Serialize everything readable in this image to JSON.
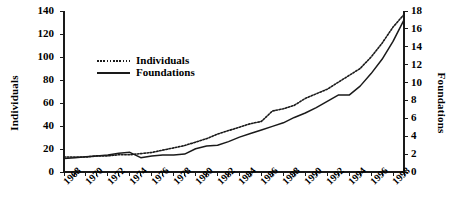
{
  "chart_data": {
    "type": "line",
    "title": "",
    "xlabel": "",
    "grid": false,
    "legend_position": "upper-left-inside",
    "x": [
      1968,
      1969,
      1970,
      1971,
      1972,
      1973,
      1974,
      1975,
      1976,
      1977,
      1978,
      1979,
      1980,
      1981,
      1982,
      1983,
      1984,
      1985,
      1986,
      1987,
      1988,
      1989,
      1990,
      1991,
      1992,
      1993,
      1994,
      1995,
      1996,
      1997,
      1998,
      1999
    ],
    "x_tick_labels": [
      "1968",
      "1970",
      "1972",
      "1974",
      "1976",
      "1978",
      "1980",
      "1982",
      "1984",
      "1986",
      "1988",
      "1990",
      "1992",
      "1994",
      "1996",
      "1998"
    ],
    "x_tick_label_step": 2,
    "xlim": [
      1968,
      1999
    ],
    "axes": [
      {
        "id": "left",
        "label": "Individuals",
        "ylim": [
          0,
          140
        ],
        "yticks": [
          0,
          20,
          40,
          60,
          80,
          100,
          120,
          140
        ],
        "side": "left"
      },
      {
        "id": "right",
        "label": "Foundations",
        "ylim": [
          0,
          18
        ],
        "yticks": [
          0,
          2,
          4,
          6,
          8,
          10,
          12,
          14,
          16,
          18
        ],
        "side": "right"
      }
    ],
    "series": [
      {
        "name": "Individuals",
        "axis": "left",
        "style": "dotted",
        "color": "#1a1a1a",
        "values": [
          13,
          13,
          13,
          14,
          14,
          15,
          15,
          16,
          17,
          19,
          21,
          23,
          26,
          29,
          33,
          36,
          39,
          42,
          44,
          53,
          55,
          58,
          64,
          68,
          72,
          78,
          84,
          90,
          100,
          112,
          126,
          137
        ]
      },
      {
        "name": "Foundations",
        "axis": "right",
        "style": "solid",
        "color": "#1a1a1a",
        "values": [
          1.5,
          1.6,
          1.7,
          1.8,
          1.9,
          2.1,
          2.2,
          1.6,
          1.8,
          1.9,
          1.9,
          2.0,
          2.6,
          2.9,
          3.0,
          3.4,
          3.9,
          4.3,
          4.7,
          5.1,
          5.5,
          6.1,
          6.6,
          7.2,
          7.9,
          8.6,
          8.6,
          9.6,
          11.0,
          12.6,
          14.6,
          17.0
        ]
      }
    ]
  },
  "legend": {
    "entries": [
      {
        "label": "Individuals",
        "style": "dotted"
      },
      {
        "label": "Foundations",
        "style": "solid"
      }
    ]
  }
}
